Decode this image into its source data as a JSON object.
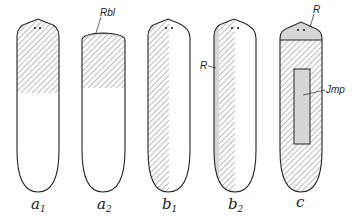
{
  "figure": {
    "panels": [
      {
        "id": "a1",
        "caption_main": "a",
        "caption_sub": "1",
        "description": "anterior half hatched"
      },
      {
        "id": "a2",
        "caption_main": "a",
        "caption_sub": "2",
        "description": "anterior half hatched with stippled rim",
        "annotation": "Rbl"
      },
      {
        "id": "b1",
        "caption_main": "b",
        "caption_sub": "1",
        "description": "left lengthwise half hatched"
      },
      {
        "id": "b2",
        "caption_main": "b",
        "caption_sub": "2",
        "description": "left half hatched with stippled lateral strip",
        "annotation": "R"
      },
      {
        "id": "c",
        "caption_main": "c",
        "caption_sub": "",
        "description": "body hatched, stippled head cap and central implant",
        "annotations": [
          "R",
          "Jmp"
        ]
      }
    ],
    "colors": {
      "line": "#222222",
      "hatch": "#555555",
      "stipple": "#bbbbbb",
      "background": "#ffffff"
    }
  }
}
